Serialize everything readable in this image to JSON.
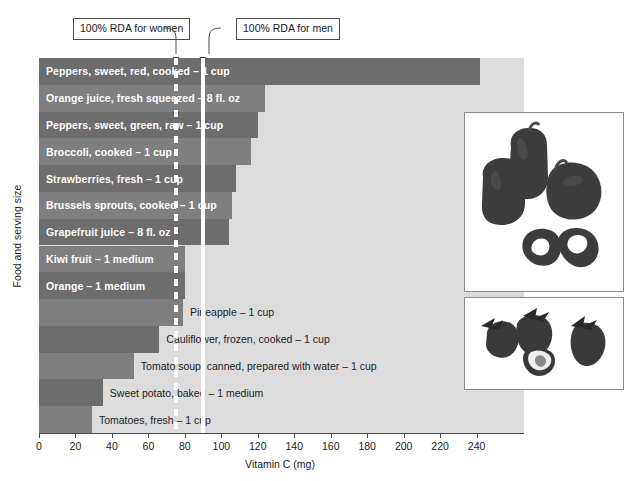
{
  "chart_data": {
    "type": "bar",
    "orientation": "horizontal",
    "title": "",
    "xlabel": "Vitamin C (mg)",
    "ylabel": "Food and serving size",
    "xlim": [
      0,
      266
    ],
    "xticks": [
      0,
      20,
      40,
      60,
      80,
      100,
      120,
      140,
      160,
      180,
      200,
      220,
      240
    ],
    "grid": false,
    "legend": null,
    "categories": [
      "Peppers, sweet, red, cooked – 1 cup",
      "Orange juice, fresh squeezed – 8 fl. oz",
      "Peppers, sweet, green, raw – 1 cup",
      "Broccoli, cooked – 1 cup",
      "Strawberries, fresh – 1 cup",
      "Brussels sprouts, cooked – 1 cup",
      "Grapefruit juice – 8 fl. oz",
      "Kiwi fruit – 1 medium",
      "Orange – 1 medium",
      "Pineapple – 1 cup",
      "Cauliflower, frozen, cooked – 1 cup",
      "Tomato soup, canned, prepared with water – 1 cup",
      "Sweet potato, baked – 1 medium",
      "Tomatoes, fresh – 1 cup"
    ],
    "values": [
      242,
      124,
      120,
      116,
      108,
      106,
      104,
      80,
      80,
      79,
      66,
      52,
      35,
      29
    ],
    "annotations": [
      {
        "label": "100% RDA for women",
        "value": 75
      },
      {
        "label": "100% RDA for men",
        "value": 90
      }
    ]
  },
  "bars": [
    {
      "label": "Peppers, sweet, red, cooked – 1 cup",
      "value": 242,
      "label_inside": true,
      "tone": "dark"
    },
    {
      "label": "Orange juice, fresh squeezed – 8 fl. oz",
      "value": 124,
      "label_inside": true,
      "tone": "med"
    },
    {
      "label": "Peppers, sweet, green, raw – 1 cup",
      "value": 120,
      "label_inside": true,
      "tone": "dark"
    },
    {
      "label": "Broccoli, cooked – 1 cup",
      "value": 116,
      "label_inside": true,
      "tone": "med"
    },
    {
      "label": "Strawberries, fresh – 1 cup",
      "value": 108,
      "label_inside": true,
      "tone": "dark"
    },
    {
      "label": "Brussels sprouts, cooked – 1 cup",
      "value": 106,
      "label_inside": true,
      "tone": "med"
    },
    {
      "label": "Grapefruit juice – 8 fl. oz",
      "value": 104,
      "label_inside": true,
      "tone": "dark"
    },
    {
      "label": "Kiwi fruit – 1 medium",
      "value": 80,
      "label_inside": true,
      "tone": "med"
    },
    {
      "label": "Orange – 1 medium",
      "value": 80,
      "label_inside": true,
      "tone": "dark"
    },
    {
      "label": "Pineapple – 1 cup",
      "value": 79,
      "label_inside": false,
      "tone": "med"
    },
    {
      "label": "Cauliflower, frozen, cooked – 1 cup",
      "value": 66,
      "label_inside": false,
      "tone": "dark"
    },
    {
      "label": "Tomato soup, canned, prepared with water – 1 cup",
      "value": 52,
      "label_inside": false,
      "tone": "med"
    },
    {
      "label": "Sweet potato, baked – 1 medium",
      "value": 35,
      "label_inside": false,
      "tone": "dark"
    },
    {
      "label": "Tomatoes, fresh – 1 cup",
      "value": 29,
      "label_inside": false,
      "tone": "med"
    }
  ],
  "axis": {
    "x_title": "Vitamin C (mg)",
    "y_title": "Food and serving size",
    "ticks": [
      "0",
      "20",
      "40",
      "60",
      "80",
      "100",
      "120",
      "140",
      "160",
      "180",
      "200",
      "220",
      "240"
    ]
  },
  "callouts": {
    "women": "100% RDA for women",
    "men": "100% RDA for men"
  },
  "photos": [
    {
      "name": "bell-peppers-photo",
      "alt": "Red bell peppers, whole and sliced rings"
    },
    {
      "name": "strawberries-photo",
      "alt": "Fresh strawberries, whole and halved"
    }
  ],
  "colors": {
    "bar_dark": "#6d6d6d",
    "bar_medium": "#7f7f7f",
    "plot_background": "#dcdcdc",
    "guide_line": "#ffffff",
    "axis": "#4a4a4a",
    "page_background": "#ffffff"
  }
}
